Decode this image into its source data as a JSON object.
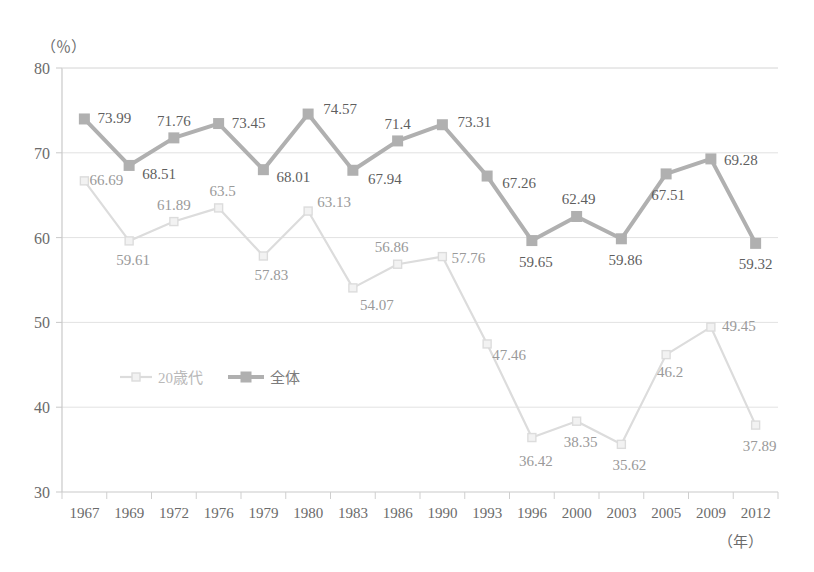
{
  "chart_data": {
    "type": "line",
    "title": "",
    "xlabel": "（年）",
    "ylabel": "（％）",
    "ylim": [
      30,
      80
    ],
    "yticks": [
      30,
      40,
      50,
      60,
      70,
      80
    ],
    "ytick_labels": [
      "30",
      "40",
      "50",
      "60",
      "70",
      "80"
    ],
    "grid": true,
    "legend_position": "inside-left",
    "categories": [
      "1967",
      "1969",
      "1972",
      "1976",
      "1979",
      "1980",
      "1983",
      "1986",
      "1990",
      "1993",
      "1996",
      "2000",
      "2003",
      "2005",
      "2009",
      "2012"
    ],
    "series": [
      {
        "name": "20歳代",
        "color": "#dcdcdc",
        "marker": "square-open",
        "values": [
          66.69,
          59.61,
          61.89,
          63.5,
          57.83,
          63.13,
          54.07,
          56.86,
          57.76,
          47.46,
          36.42,
          38.35,
          35.62,
          46.2,
          49.45,
          37.89
        ],
        "labels": [
          "66.69",
          "59.61",
          "61.89",
          "63.5",
          "57.83",
          "63.13",
          "54.07",
          "56.86",
          "57.76",
          "47.46",
          "36.42",
          "38.35",
          "35.62",
          "46.2",
          "49.45",
          "37.89"
        ]
      },
      {
        "name": "全体",
        "color": "#b0b0b0",
        "marker": "square-filled",
        "values": [
          73.99,
          68.51,
          71.76,
          73.45,
          68.01,
          74.57,
          67.94,
          71.4,
          73.31,
          67.26,
          59.65,
          62.49,
          59.86,
          67.51,
          69.28,
          59.32
        ],
        "labels": [
          "73.99",
          "68.51",
          "71.76",
          "73.45",
          "68.01",
          "74.57",
          "67.94",
          "71.4",
          "73.31",
          "67.26",
          "59.65",
          "62.49",
          "59.86",
          "67.51",
          "69.28",
          "59.32"
        ]
      }
    ],
    "label_offsets": {
      "twenties": [
        {
          "dx": 22,
          "dy": 4
        },
        {
          "dx": 4,
          "dy": 24
        },
        {
          "dx": 0,
          "dy": -12
        },
        {
          "dx": 4,
          "dy": -12
        },
        {
          "dx": 8,
          "dy": 24
        },
        {
          "dx": 26,
          "dy": -4
        },
        {
          "dx": 24,
          "dy": 22
        },
        {
          "dx": -6,
          "dy": -12
        },
        {
          "dx": 26,
          "dy": 6
        },
        {
          "dx": 22,
          "dy": 16
        },
        {
          "dx": 4,
          "dy": 28
        },
        {
          "dx": 4,
          "dy": 26
        },
        {
          "dx": 8,
          "dy": 26
        },
        {
          "dx": 4,
          "dy": 22
        },
        {
          "dx": 28,
          "dy": 4
        },
        {
          "dx": 4,
          "dy": 26
        }
      ],
      "overall": [
        {
          "dx": 30,
          "dy": 4
        },
        {
          "dx": 30,
          "dy": 14
        },
        {
          "dx": 0,
          "dy": -12
        },
        {
          "dx": 30,
          "dy": 4
        },
        {
          "dx": 30,
          "dy": 12
        },
        {
          "dx": 32,
          "dy": 0
        },
        {
          "dx": 32,
          "dy": 14
        },
        {
          "dx": 0,
          "dy": -12
        },
        {
          "dx": 32,
          "dy": 2
        },
        {
          "dx": 32,
          "dy": 12
        },
        {
          "dx": 4,
          "dy": 26
        },
        {
          "dx": 2,
          "dy": -12
        },
        {
          "dx": 4,
          "dy": 26
        },
        {
          "dx": 2,
          "dy": 26
        },
        {
          "dx": 30,
          "dy": 6
        },
        {
          "dx": 0,
          "dy": 26
        }
      ]
    }
  },
  "legend": {
    "items": [
      {
        "label": "20歳代",
        "color": "#dcdcdc",
        "style": "faint"
      },
      {
        "label": "全体",
        "color": "#b0b0b0",
        "style": "solid"
      }
    ]
  }
}
